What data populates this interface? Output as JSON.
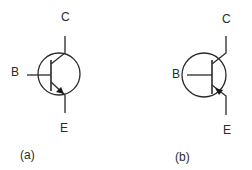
{
  "diagram": {
    "type": "bipolar-transistor-symbols",
    "colors": {
      "stroke": "#2a2a2a",
      "background": "#ffffff"
    },
    "transistors": [
      {
        "id": "a",
        "caption": "(a)",
        "polarity": "NPN",
        "arrow_direction": "outward",
        "terminals": {
          "collector": "C",
          "base": "B",
          "emitter": "E"
        }
      },
      {
        "id": "b",
        "caption": "(b)",
        "polarity": "PNP",
        "arrow_direction": "inward",
        "terminals": {
          "collector": "C",
          "base": "B",
          "emitter": "E"
        }
      }
    ]
  }
}
